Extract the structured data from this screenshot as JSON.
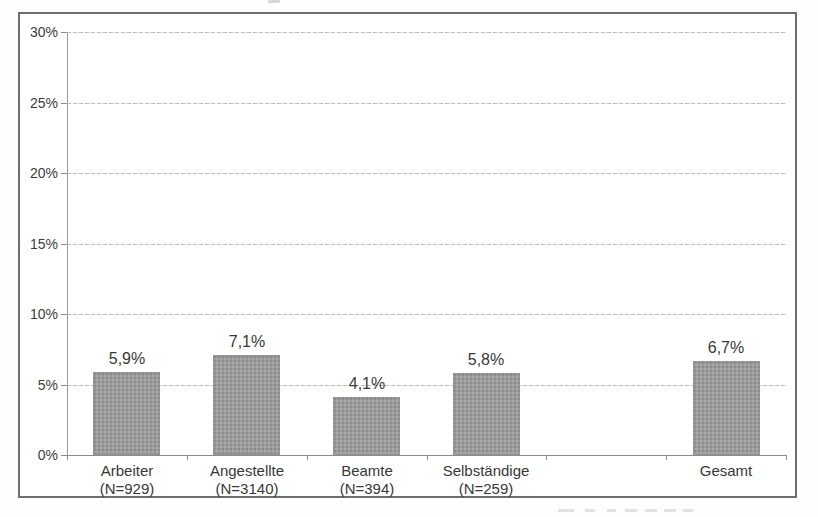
{
  "chart_data": {
    "type": "bar",
    "title": "",
    "xlabel": "",
    "ylabel": "",
    "ylim": [
      0,
      30
    ],
    "ytick_step": 5,
    "ytick_labels": [
      "0%",
      "5%",
      "10%",
      "15%",
      "20%",
      "25%",
      "30%"
    ],
    "grid": "horizontal-dashed",
    "legend": "none",
    "bar_color": "#9b9b9b",
    "categories": [
      "Arbeiter",
      "Angestellte",
      "Beamte",
      "Selbständige",
      "",
      "Gesamt"
    ],
    "category_sublabels": [
      "(N=929)",
      "(N=3140)",
      "(N=394)",
      "(N=259)",
      "",
      ""
    ],
    "values": [
      5.9,
      7.1,
      4.1,
      5.8,
      null,
      6.7
    ],
    "value_labels": [
      "5,9%",
      "7,1%",
      "4,1%",
      "5,8%",
      "",
      "6,7%"
    ]
  }
}
